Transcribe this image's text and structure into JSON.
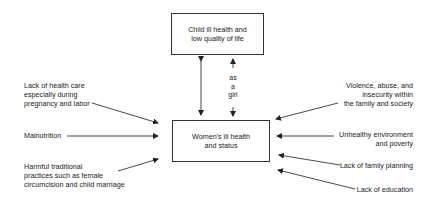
{
  "diagram": {
    "top_box": {
      "lines": [
        "Child ill health and",
        "low quality of life"
      ]
    },
    "center_box": {
      "lines": [
        "Women's ill health",
        "and status"
      ]
    },
    "link_label": {
      "lines": [
        "as",
        "a",
        "girl"
      ]
    },
    "left_causes": [
      {
        "lines": [
          "Lack of health care",
          "especially during",
          "pregnancy and labor"
        ]
      },
      {
        "lines": [
          "Malnutrition"
        ]
      },
      {
        "lines": [
          "Harmful traditional",
          "practices such as female",
          "circumcision and child marriage"
        ]
      }
    ],
    "right_causes": [
      {
        "lines": [
          "Violence, abuse, and",
          "insecurity within",
          "the family and society"
        ]
      },
      {
        "lines": [
          "Unhealthy environment",
          "and poverty"
        ]
      },
      {
        "lines": [
          "Lack of family planning"
        ]
      },
      {
        "lines": [
          "Lack of education"
        ]
      }
    ],
    "colors": {
      "line": "#333333",
      "text": "#1a1a1a",
      "background": "#ffffff"
    }
  }
}
